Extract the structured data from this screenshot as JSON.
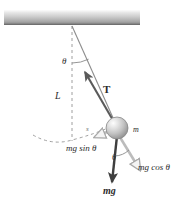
{
  "figure": {
    "type": "physics-diagram",
    "background_color": "#ffffff"
  },
  "ceiling": {
    "name": "ceiling-support-bar",
    "x": 4,
    "y": 10,
    "width": 136,
    "height": 15,
    "color_top": "#f2f2f2",
    "color_mid": "#c9c9c9",
    "color_bottom": "#8c8c8c"
  },
  "pivot": {
    "x": 72,
    "y": 25
  },
  "bob": {
    "name": "pendulum-bob",
    "cx": 117,
    "cy": 128,
    "r": 11,
    "fill_light": "#f6f6f6",
    "fill_mid": "#cfcfcf",
    "fill_dark": "#9a9a9a",
    "outline": "#7a7a7a"
  },
  "labels": {
    "theta_top": "θ",
    "length_L": "L",
    "tension_T": "T",
    "arc_s": "s",
    "mass_m": "m",
    "mg_sin_theta": "mg sin θ",
    "theta_bob": "θ",
    "mg_cos_theta": "mg cos θ",
    "weight_mg": "mg"
  },
  "vectors": {
    "tension": {
      "label": "T",
      "from_x": 117,
      "from_y": 128,
      "to_x": 85,
      "to_y": 72,
      "style": "solid-filled",
      "color": "#5a5a5a"
    },
    "weight": {
      "label": "mg",
      "from_x": 117,
      "from_y": 134,
      "to_x": 112,
      "to_y": 184,
      "style": "solid-filled-bold",
      "color": "#4a4a4a"
    },
    "mg_cos_theta": {
      "label": "mg cos θ",
      "from_x": 117,
      "from_y": 134,
      "to_x": 141,
      "to_y": 172,
      "style": "hollow-outline",
      "color": "#b0b0b0"
    },
    "mg_sin_theta": {
      "label": "mg sin θ",
      "from_x": 112,
      "from_y": 131,
      "to_x": 93,
      "to_y": 139,
      "style": "hollow-outline",
      "color": "#b0b0b0"
    }
  },
  "lines": {
    "vertical_dashed": {
      "name": "equilibrium-reference-line",
      "from_x": 72,
      "from_y": 25,
      "to_x": 72,
      "to_y": 140,
      "dash": "3 3",
      "color": "#9a9a9a"
    },
    "string": {
      "name": "pendulum-string",
      "from_x": 72,
      "from_y": 25,
      "to_x": 117,
      "to_y": 128,
      "color": "#8a8a8a"
    },
    "swing_arc": {
      "name": "pendulum-path-arc",
      "dash": "3 3",
      "color": "#9a9a9a"
    }
  },
  "angles": {
    "theta_top_arc": {
      "cx": 72,
      "cy": 25,
      "r": 38
    },
    "theta_bob_arc": {
      "cx": 117,
      "cy": 134,
      "r": 22
    }
  }
}
